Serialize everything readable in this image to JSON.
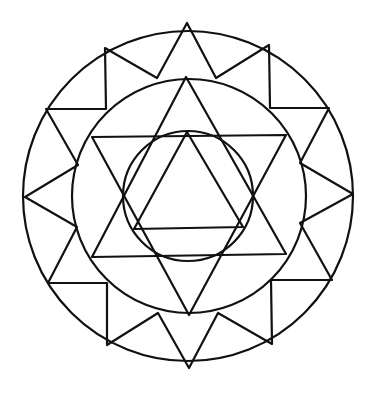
{
  "figure": {
    "type": "mandala",
    "background": "#ffffff",
    "stroke_color": "#111111",
    "circles": [
      {
        "name": "outer",
        "cx": 188,
        "cy": 196,
        "r": 165
      },
      {
        "name": "middle",
        "cx": 189,
        "cy": 196,
        "r": 117
      },
      {
        "name": "inner",
        "cx": 188,
        "cy": 196,
        "r": 65
      }
    ],
    "outer_zigzag": "187,23 216,78 269,45 270,108 329,108 300,163 353,194 300,223 332,280 271,280 272,344 218,313 189,368 158,313 107,345 107,283 48,283 77,227 25,197 78,165 46,109 106,109 105,48 157,78 187,23",
    "hexagram_up": "186,77 286,254 92,257",
    "hexagram_down": "92,137 286,135 189,315",
    "inner_triangle": "187,132 243,227 134,229"
  }
}
